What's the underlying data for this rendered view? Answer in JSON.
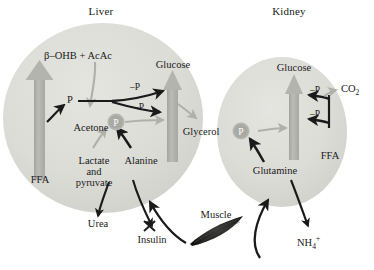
{
  "figure": {
    "title_hidden": "Gluconeogenesis and ketogenesis in liver and kidney",
    "background_color": "#ffffff",
    "organ_fill_color": "#dcdcd7",
    "gray_arrow_color": "#b0b0ab",
    "black_arrow_color": "#1a1a1a",
    "p_node_fill": "#a9a9a4"
  },
  "organs": [
    {
      "id": "liver",
      "label": "Liver"
    },
    {
      "id": "kidney",
      "label": "Kidney"
    }
  ],
  "liver": {
    "title": "Liver",
    "nodes": {
      "ketones": "β–OHB + AcAc",
      "ffa": "FFA",
      "glucose": "Glucose",
      "acetone": "Acetone",
      "glycerol": "Glycerol",
      "lactate_pyruvate_line1": "Lactate",
      "lactate_pyruvate_line2": "and",
      "lactate_pyruvate_line3": "pyruvate",
      "alanine": "Alanine",
      "p_hub": "P",
      "p_inline": "P"
    },
    "edge_labels": {
      "minus_p_upper": "–P",
      "minus_p_lower": "–P"
    }
  },
  "kidney": {
    "title": "Kidney",
    "nodes": {
      "glucose": "Glucose",
      "ffa": "FFA",
      "glutamine": "Glutamine",
      "co2": "CO2",
      "p_hub": "P"
    },
    "edge_labels": {
      "minus_p_upper": "–P",
      "minus_p_lower": "–P"
    }
  },
  "external": {
    "urea": "Urea",
    "insulin": "Insulin",
    "muscle": "Muscle",
    "ammonium": "NH4+"
  }
}
